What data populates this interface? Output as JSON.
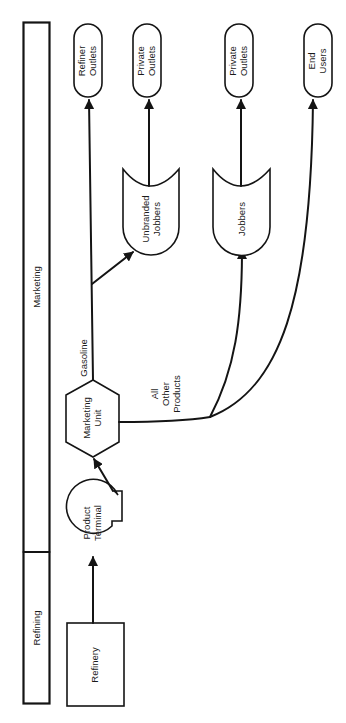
{
  "diagram": {
    "orientation": "rotated-90-ccw",
    "stages": [
      {
        "id": "refining",
        "label": "Refining"
      },
      {
        "id": "marketing",
        "label": "Marketing"
      }
    ],
    "nodes": {
      "refinery": {
        "label": "Refinery",
        "shape": "rectangle"
      },
      "product_terminal": {
        "line1": "Product",
        "line2": "Terminal",
        "shape": "storage-circle"
      },
      "marketing_unit": {
        "line1": "Marketing",
        "line2": "Unit",
        "shape": "hexagon"
      },
      "unbranded_jobbers": {
        "line1": "Unbranded",
        "line2": "Jobbers",
        "shape": "tank"
      },
      "jobbers": {
        "label": "Jobbers",
        "shape": "tank"
      },
      "refiner_outlets": {
        "line1": "Refiner",
        "line2": "Outlets",
        "shape": "terminal"
      },
      "private_outlets_1": {
        "line1": "Private",
        "line2": "Outlets",
        "shape": "terminal"
      },
      "private_outlets_2": {
        "line1": "Private",
        "line2": "Outlets",
        "shape": "terminal"
      },
      "end_users": {
        "line1": "End",
        "line2": "Users",
        "shape": "terminal"
      }
    },
    "edge_labels": {
      "gasoline": "Gasoline",
      "all_other_1": "All",
      "all_other_2": "Other",
      "all_other_3": "Products"
    },
    "edges": [
      {
        "from": "refinery",
        "to": "product_terminal"
      },
      {
        "from": "product_terminal",
        "to": "marketing_unit"
      },
      {
        "from": "marketing_unit",
        "to": "refiner_outlets",
        "label": "Gasoline"
      },
      {
        "from": "marketing_unit",
        "to": "unbranded_jobbers",
        "label": "Gasoline"
      },
      {
        "from": "unbranded_jobbers",
        "to": "private_outlets_1"
      },
      {
        "from": "marketing_unit",
        "to": "jobbers",
        "label": "All Other Products"
      },
      {
        "from": "marketing_unit",
        "to": "end_users",
        "label": "All Other Products"
      },
      {
        "from": "jobbers",
        "to": "private_outlets_2"
      }
    ],
    "colors": {
      "ink": "#141414",
      "background": "#ffffff"
    }
  }
}
